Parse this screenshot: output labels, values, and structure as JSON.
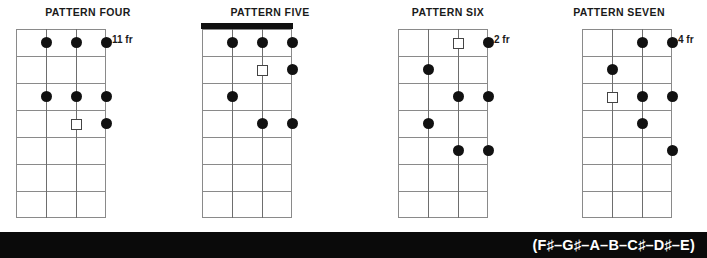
{
  "diagram": {
    "instrument_strings": 4,
    "fret_count": 7,
    "patterns": [
      {
        "id": "pattern-four",
        "title": "PATTERN FOUR",
        "fret_label": "11 fr",
        "has_nut": false,
        "markers": [
          {
            "string": 2,
            "fret": 1,
            "type": "filled"
          },
          {
            "string": 3,
            "fret": 1,
            "type": "filled"
          },
          {
            "string": 4,
            "fret": 1,
            "type": "filled"
          },
          {
            "string": 2,
            "fret": 3,
            "type": "filled"
          },
          {
            "string": 3,
            "fret": 3,
            "type": "filled"
          },
          {
            "string": 4,
            "fret": 3,
            "type": "filled"
          },
          {
            "string": 3,
            "fret": 4,
            "type": "open"
          },
          {
            "string": 4,
            "fret": 4,
            "type": "filled"
          }
        ]
      },
      {
        "id": "pattern-five",
        "title": "PATTERN FIVE",
        "fret_label": "",
        "has_nut": true,
        "markers": [
          {
            "string": 2,
            "fret": 1,
            "type": "filled"
          },
          {
            "string": 3,
            "fret": 1,
            "type": "filled"
          },
          {
            "string": 4,
            "fret": 1,
            "type": "filled"
          },
          {
            "string": 3,
            "fret": 2,
            "type": "open"
          },
          {
            "string": 4,
            "fret": 2,
            "type": "filled"
          },
          {
            "string": 2,
            "fret": 3,
            "type": "filled"
          },
          {
            "string": 3,
            "fret": 4,
            "type": "filled"
          },
          {
            "string": 4,
            "fret": 4,
            "type": "filled"
          }
        ]
      },
      {
        "id": "pattern-six",
        "title": "PATTERN SIX",
        "fret_label": "2 fr",
        "has_nut": false,
        "markers": [
          {
            "string": 3,
            "fret": 1,
            "type": "open"
          },
          {
            "string": 4,
            "fret": 1,
            "type": "filled"
          },
          {
            "string": 2,
            "fret": 2,
            "type": "filled"
          },
          {
            "string": 3,
            "fret": 3,
            "type": "filled"
          },
          {
            "string": 4,
            "fret": 3,
            "type": "filled"
          },
          {
            "string": 2,
            "fret": 4,
            "type": "filled"
          },
          {
            "string": 3,
            "fret": 5,
            "type": "filled"
          },
          {
            "string": 4,
            "fret": 5,
            "type": "filled"
          }
        ]
      },
      {
        "id": "pattern-seven",
        "title": "PATTERN SEVEN",
        "fret_label": "4 fr",
        "has_nut": false,
        "markers": [
          {
            "string": 3,
            "fret": 1,
            "type": "filled"
          },
          {
            "string": 4,
            "fret": 1,
            "type": "filled"
          },
          {
            "string": 2,
            "fret": 2,
            "type": "filled"
          },
          {
            "string": 2,
            "fret": 3,
            "type": "open"
          },
          {
            "string": 3,
            "fret": 3,
            "type": "filled"
          },
          {
            "string": 4,
            "fret": 3,
            "type": "filled"
          },
          {
            "string": 3,
            "fret": 4,
            "type": "filled"
          },
          {
            "string": 4,
            "fret": 5,
            "type": "filled"
          }
        ]
      }
    ]
  },
  "footer": {
    "scale_formula": "(F♯–G♯–A–B–C♯–D♯–E)",
    "band_color": "#0a0a0a",
    "text_color": "#ffffff"
  },
  "colors": {
    "grid_line": "#8a8a8a",
    "string_line": "#6e6e6e",
    "marker_filled": "#111111",
    "marker_open_border": "#444444",
    "nut": "#111111",
    "title_text": "#1a1a1a",
    "background": "#ffffff"
  }
}
